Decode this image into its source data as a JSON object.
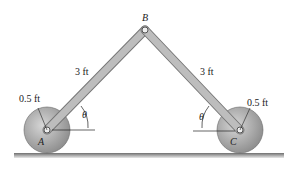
{
  "diagram": {
    "point_labels": {
      "a": "A",
      "b": "B",
      "c": "C"
    },
    "lengths": {
      "ab": "3 ft",
      "bc": "3 ft"
    },
    "radii": {
      "left": "0.5 ft",
      "right": "0.5 ft"
    },
    "angles": {
      "left": "θ",
      "right": "θ"
    },
    "colors": {
      "link": "#b9b9b9",
      "wheel": "#a8a8a8",
      "ground": "#8a8a8a"
    }
  }
}
